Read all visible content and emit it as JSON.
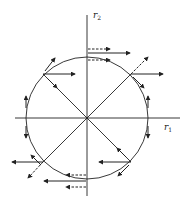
{
  "diagram": {
    "type": "phase-plane vector diagram",
    "colors": {
      "ink": "#222222",
      "background": "#ffffff"
    },
    "axes": {
      "horizontal": {
        "label": "r",
        "subscript": "1"
      },
      "vertical": {
        "label": "r",
        "subscript": "2"
      }
    },
    "circle": {
      "center": [
        87,
        118
      ],
      "radius": 61
    },
    "diagonals": [
      "45deg",
      "135deg"
    ],
    "vector_legend": {
      "solid": "solid arrow",
      "dashed": "dashed arrow"
    }
  }
}
